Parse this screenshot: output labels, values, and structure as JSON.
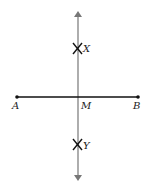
{
  "diagram": {
    "title": "",
    "points": {
      "A": {
        "label": "A"
      },
      "B": {
        "label": "B"
      },
      "M": {
        "label": "M"
      },
      "X": {
        "label": "X"
      },
      "Y": {
        "label": "Y"
      }
    },
    "colors": {
      "segment": "#111111",
      "bisector": "#777777",
      "marks": "#111111"
    }
  }
}
